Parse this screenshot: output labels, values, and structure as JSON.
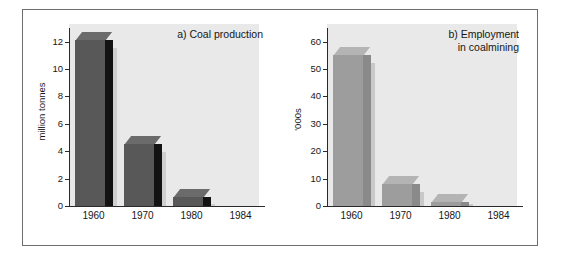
{
  "figure": {
    "background_color": "#ffffff",
    "border_color": "#6e6e6e",
    "panel_color": "#e9e9e9"
  },
  "chart_data": [
    {
      "type": "bar",
      "panel": "a",
      "title": "a) Coal production",
      "xlabel": "",
      "ylabel": "million tonnes",
      "categories": [
        "1960",
        "1970",
        "1980",
        "1984"
      ],
      "values": [
        12.1,
        4.5,
        0.65,
        0
      ],
      "ylim": [
        0,
        13
      ],
      "yticks": [
        0,
        2,
        4,
        6,
        8,
        10,
        12
      ],
      "ytick_labels": [
        "0",
        "2",
        "4",
        "6",
        "8",
        "10",
        "12"
      ],
      "grid": false,
      "legend": "none",
      "bar_color": "#585858",
      "bar_side_color": "#131313",
      "bar_top_color": "#6b6b6b"
    },
    {
      "type": "bar",
      "panel": "b",
      "title": "b) Employment\nin coalmining",
      "xlabel": "",
      "ylabel": "'000s",
      "categories": [
        "1960",
        "1970",
        "1980",
        "1984"
      ],
      "values": [
        55,
        8,
        1.5,
        0
      ],
      "ylim": [
        0,
        65
      ],
      "yticks": [
        0,
        10,
        20,
        30,
        40,
        50,
        60
      ],
      "ytick_labels": [
        "0",
        "10",
        "20",
        "30",
        "40",
        "50",
        "60"
      ],
      "grid": false,
      "legend": "none",
      "bar_color": "#9d9d9d",
      "bar_side_color": "#8a8a8a",
      "bar_top_color": "#b4b4b4"
    }
  ]
}
